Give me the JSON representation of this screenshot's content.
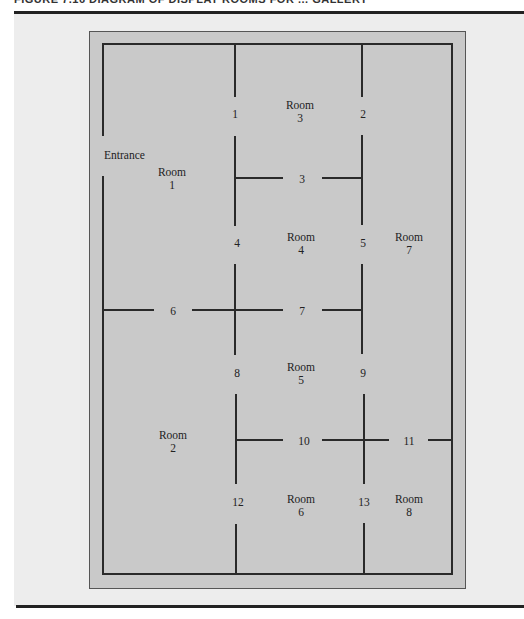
{
  "figure": {
    "caption": "FIGURE 7.16   DIAGRAM OF DISPLAY ROOMS FOR ... GALLERY"
  },
  "colors": {
    "page_bg": "#ededed",
    "outer_fill": "#c9c9c9",
    "inner_fill": "#c6c6c6",
    "wall": "#2a2a2a",
    "rule": "#222222"
  },
  "labels": {
    "entrance": "Entrance",
    "room_word": "Room"
  },
  "rooms": [
    {
      "id": "1",
      "x": 172,
      "y": 176
    },
    {
      "id": "2",
      "x": 173,
      "y": 439
    },
    {
      "id": "3",
      "x": 300,
      "y": 109
    },
    {
      "id": "4",
      "x": 301,
      "y": 241
    },
    {
      "id": "5",
      "x": 301,
      "y": 371
    },
    {
      "id": "6",
      "x": 301,
      "y": 503
    },
    {
      "id": "7",
      "x": 409,
      "y": 241
    },
    {
      "id": "8",
      "x": 409,
      "y": 503
    }
  ],
  "doors": [
    {
      "id": "1",
      "x": 235,
      "y": 118
    },
    {
      "id": "2",
      "x": 363,
      "y": 118
    },
    {
      "id": "3",
      "x": 302,
      "y": 183
    },
    {
      "id": "4",
      "x": 237,
      "y": 247
    },
    {
      "id": "5",
      "x": 363,
      "y": 247
    },
    {
      "id": "6",
      "x": 173,
      "y": 315
    },
    {
      "id": "7",
      "x": 302,
      "y": 315
    },
    {
      "id": "8",
      "x": 237,
      "y": 377
    },
    {
      "id": "9",
      "x": 363,
      "y": 377
    },
    {
      "id": "10",
      "x": 304,
      "y": 445
    },
    {
      "id": "11",
      "x": 409,
      "y": 445
    },
    {
      "id": "12",
      "x": 238,
      "y": 506
    },
    {
      "id": "13",
      "x": 364,
      "y": 506
    }
  ]
}
